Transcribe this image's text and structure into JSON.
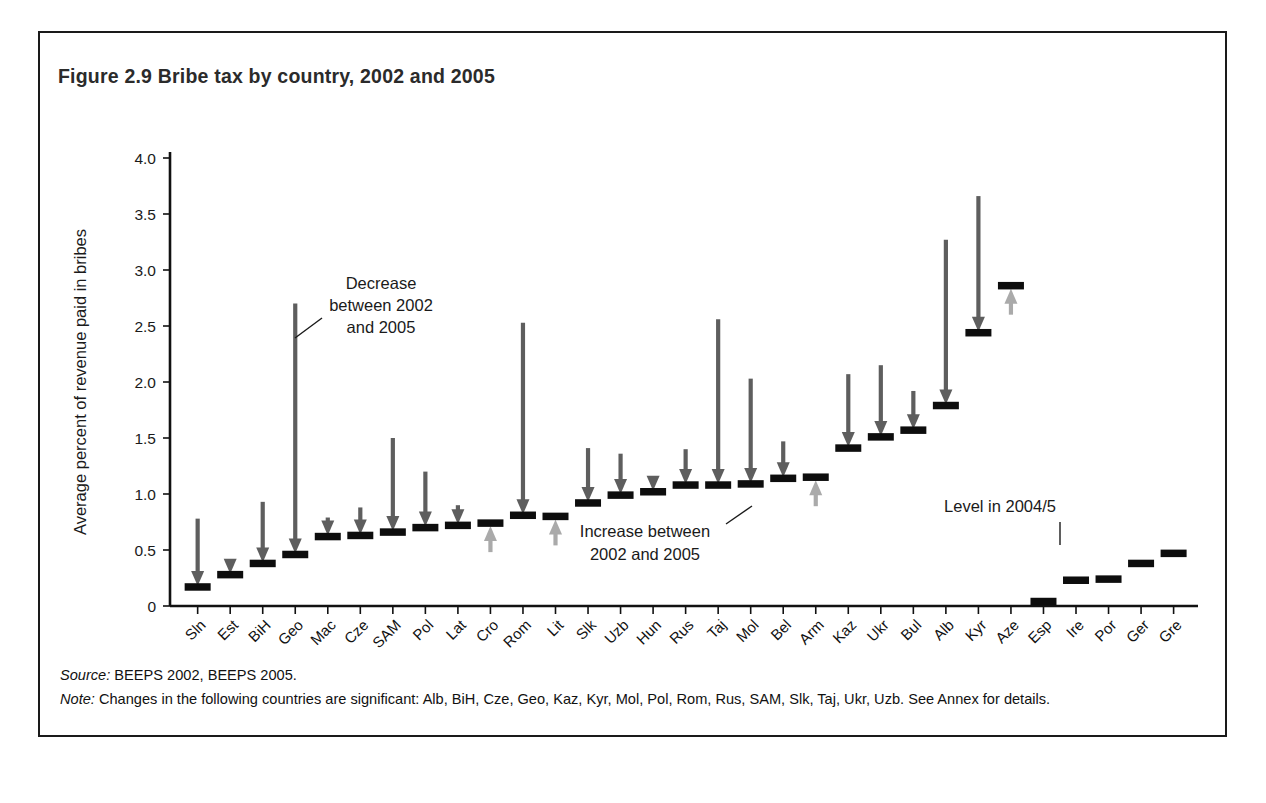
{
  "figure": {
    "title": "Figure 2.9  Bribe tax by country, 2002 and 2005",
    "source_label": "Source:",
    "source_text": " BEEPS 2002, BEEPS 2005.",
    "note_label": "Note:",
    "note_text": " Changes in the following countries are significant: Alb, BiH, Cze, Geo, Kaz, Kyr, Mol, Pol, Rom, Rus, SAM, Slk, Taj, Ukr, Uzb. See Annex for details."
  },
  "annotations": {
    "decrease": "Decrease\nbetween 2002\nand 2005",
    "decrease_l1": "Decrease",
    "decrease_l2": "between 2002",
    "decrease_l3": "and 2005",
    "increase_l1": "Increase between",
    "increase_l2": "2002 and 2005",
    "level": "Level in 2004/5"
  },
  "colors": {
    "decrease_arrow": "#5e5e5e",
    "increase_arrow": "#aaaaaa",
    "level_bar": "#0d0d0d",
    "axis": "#111111",
    "title": "#2b2b2b"
  },
  "chart_data": {
    "type": "bar",
    "title": "Figure 2.9  Bribe tax by country, 2002 and 2005",
    "xlabel": "",
    "ylabel": "Average percent of revenue paid in bribes",
    "ylim": [
      0,
      4.0
    ],
    "ytick_labels": [
      "0",
      "0.5",
      "1.0",
      "1.5",
      "2.0",
      "2.5",
      "3.0",
      "3.5",
      "4.0"
    ],
    "ytick_values": [
      0,
      0.5,
      1.0,
      1.5,
      2.0,
      2.5,
      3.0,
      3.5,
      4.0
    ],
    "grid": false,
    "legend": "none",
    "categories": [
      "Sln",
      "Est",
      "BiH",
      "Geo",
      "Mac",
      "Cze",
      "SAM",
      "Pol",
      "Lat",
      "Cro",
      "Rom",
      "Lit",
      "Slk",
      "Uzb",
      "Hun",
      "Rus",
      "Taj",
      "Mol",
      "Bel",
      "Arm",
      "Kaz",
      "Ukr",
      "Bul",
      "Alb",
      "Kyr",
      "Aze",
      "Esp",
      "Ire",
      "Por",
      "Ger",
      "Gre"
    ],
    "series": [
      {
        "name": "2002 level",
        "values": [
          0.78,
          0.32,
          0.93,
          2.7,
          0.79,
          0.88,
          1.5,
          1.2,
          0.9,
          0.62,
          2.53,
          0.72,
          1.41,
          1.36,
          1.03,
          1.4,
          2.56,
          2.03,
          1.47,
          0.97,
          2.07,
          2.15,
          1.92,
          3.27,
          3.66,
          2.78,
          null,
          null,
          null,
          null,
          null
        ]
      },
      {
        "name": "2004/5 level",
        "values": [
          0.17,
          0.28,
          0.38,
          0.46,
          0.62,
          0.63,
          0.66,
          0.7,
          0.72,
          0.74,
          0.81,
          0.8,
          0.92,
          0.99,
          1.02,
          1.08,
          1.08,
          1.09,
          1.14,
          1.15,
          1.41,
          1.51,
          1.57,
          1.79,
          2.44,
          2.86,
          0.04,
          0.23,
          0.24,
          0.38,
          0.47
        ]
      }
    ],
    "change_direction": [
      "decrease",
      "decrease",
      "decrease",
      "decrease",
      "decrease",
      "decrease",
      "decrease",
      "decrease",
      "decrease",
      "increase",
      "decrease",
      "increase",
      "decrease",
      "decrease",
      "decrease",
      "decrease",
      "decrease",
      "decrease",
      "decrease",
      "increase",
      "decrease",
      "decrease",
      "decrease",
      "decrease",
      "decrease",
      "increase",
      "none",
      "none",
      "none",
      "none",
      "none"
    ]
  }
}
